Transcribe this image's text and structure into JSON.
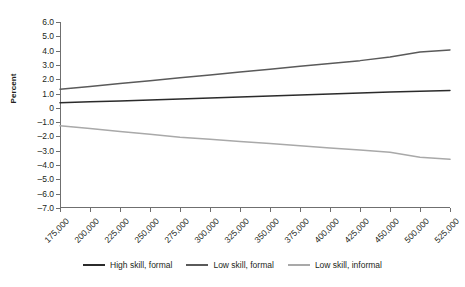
{
  "chart_data": {
    "type": "line",
    "title": "",
    "xlabel": "",
    "ylabel": "Percent",
    "grid": false,
    "legend_position": "bottom",
    "ylim": [
      -7.0,
      6.0
    ],
    "y_ticks": [
      "6.0",
      "5.0",
      "4.0",
      "3.0",
      "2.0",
      "1.0",
      "0",
      "–1.0",
      "–2.0",
      "–3.0",
      "–4.0",
      "–5.0",
      "–6.0",
      "–7.0"
    ],
    "y_tick_values": [
      6,
      5,
      4,
      3,
      2,
      1,
      0,
      -1,
      -2,
      -3,
      -4,
      -5,
      -6,
      -7
    ],
    "categories": [
      "175,000",
      "200,000",
      "225,000",
      "250,000",
      "275,000",
      "300,000",
      "325,000",
      "350,000",
      "375,000",
      "400,000",
      "425,000",
      "450,000",
      "500,000",
      "525,000"
    ],
    "series": [
      {
        "name": "High skill, formal",
        "color": "#2b2b2b",
        "values": [
          0.35,
          0.42,
          0.48,
          0.55,
          0.62,
          0.68,
          0.75,
          0.82,
          0.9,
          0.97,
          1.03,
          1.1,
          1.16,
          1.22
        ]
      },
      {
        "name": "Low skill, formal",
        "color": "#5a5a5a",
        "values": [
          1.3,
          1.5,
          1.7,
          1.9,
          2.1,
          2.3,
          2.5,
          2.7,
          2.9,
          3.1,
          3.3,
          3.55,
          3.9,
          4.05
        ]
      },
      {
        "name": "Low skill, informal",
        "color": "#a9a9a9",
        "values": [
          -1.25,
          -1.45,
          -1.65,
          -1.85,
          -2.05,
          -2.2,
          -2.35,
          -2.5,
          -2.65,
          -2.8,
          -2.95,
          -3.1,
          -3.45,
          -3.6
        ]
      }
    ]
  }
}
